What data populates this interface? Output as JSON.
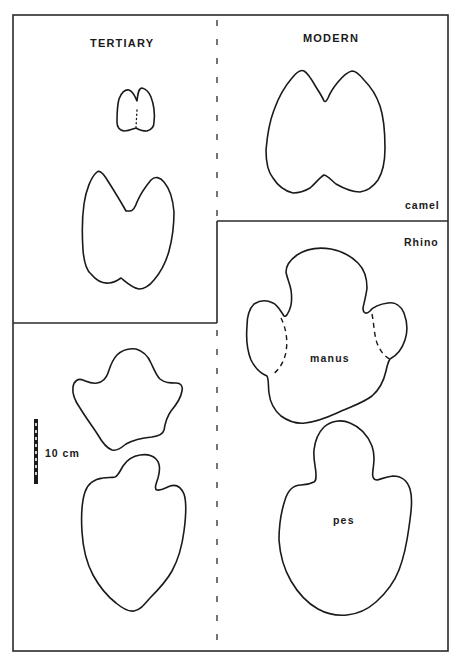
{
  "figure": {
    "sections": {
      "tertiary": {
        "label": "TERTIARY"
      },
      "modern": {
        "label": "MODERN"
      }
    },
    "species": {
      "camel": {
        "label": "camel"
      },
      "rhino": {
        "label": "Rhino"
      }
    },
    "parts": {
      "manus": {
        "label": "manus"
      },
      "pes": {
        "label": "pes"
      }
    },
    "scale_bar": {
      "label": "10 cm",
      "segments": 10
    },
    "colors": {
      "ink": "#1a1a1a",
      "background": "#ffffff"
    }
  }
}
